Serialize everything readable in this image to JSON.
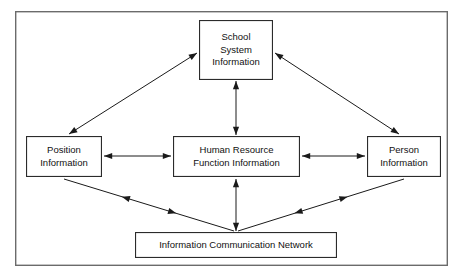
{
  "diagram": {
    "frame": {
      "name": "outer-frame",
      "x": 15,
      "y": 11,
      "width": 433,
      "height": 255,
      "stroke": "#6b6b6b",
      "stroke_width": 1.4,
      "fill": "#ffffff"
    },
    "style": {
      "box_stroke": "#2b2b2b",
      "box_fill": "#ffffff",
      "box_stroke_width": 1.1,
      "arrow_stroke": "#1a1a1a",
      "arrow_stroke_width": 1.0,
      "text_color": "#111111",
      "background": "#ffffff"
    },
    "nodes": [
      {
        "id": "school-system-information",
        "lines": [
          "School",
          "System",
          "Information"
        ],
        "x": 199,
        "y": 20,
        "width": 74,
        "height": 60
      },
      {
        "id": "position-information",
        "lines": [
          "Position",
          "Information"
        ],
        "x": 26,
        "y": 136,
        "width": 76,
        "height": 41
      },
      {
        "id": "human-resource-function-information",
        "lines": [
          "Human Resource",
          "Function Information"
        ],
        "x": 173,
        "y": 136,
        "width": 127,
        "height": 41
      },
      {
        "id": "person-information",
        "lines": [
          "Person",
          "Information"
        ],
        "x": 367,
        "y": 136,
        "width": 74,
        "height": 41
      },
      {
        "id": "information-communication-network",
        "lines": [
          "Information Communication Network"
        ],
        "x": 135,
        "y": 232,
        "width": 202,
        "height": 26
      }
    ],
    "connectors": [
      {
        "id": "position-to-school-system",
        "from": "position-information",
        "to": "school-system-information",
        "kind": "diagonal",
        "heads": "both-ends",
        "x1": 69,
        "y1": 134,
        "x2": 197,
        "y2": 53
      },
      {
        "id": "school-system-to-person",
        "from": "school-system-information",
        "to": "person-information",
        "kind": "diagonal",
        "heads": "both-ends",
        "x1": 275,
        "y1": 53,
        "x2": 399,
        "y2": 134
      },
      {
        "id": "school-system-to-human-resource",
        "from": "school-system-information",
        "to": "human-resource-function-information",
        "kind": "vertical",
        "heads": "both-ends",
        "x1": 236,
        "y1": 81,
        "x2": 236,
        "y2": 135
      },
      {
        "id": "position-to-human-resource",
        "from": "position-information",
        "to": "human-resource-function-information",
        "kind": "horizontal",
        "heads": "both-ends",
        "x1": 104,
        "y1": 156,
        "x2": 171,
        "y2": 156
      },
      {
        "id": "human-resource-to-person",
        "from": "human-resource-function-information",
        "to": "person-information",
        "kind": "horizontal",
        "heads": "both-ends",
        "x1": 302,
        "y1": 156,
        "x2": 365,
        "y2": 156
      },
      {
        "id": "human-resource-to-network",
        "from": "human-resource-function-information",
        "to": "information-communication-network",
        "kind": "vertical",
        "heads": "both-ends",
        "x1": 236,
        "y1": 179,
        "x2": 236,
        "y2": 231
      },
      {
        "id": "position-to-network",
        "from": "position-information",
        "to": "information-communication-network",
        "kind": "diagonal",
        "heads": "mid-both",
        "x1": 64,
        "y1": 179,
        "x2": 234,
        "y2": 231
      },
      {
        "id": "network-to-person",
        "from": "information-communication-network",
        "to": "person-information",
        "kind": "diagonal",
        "heads": "mid-both",
        "x1": 238,
        "y1": 231,
        "x2": 404,
        "y2": 179
      }
    ]
  }
}
